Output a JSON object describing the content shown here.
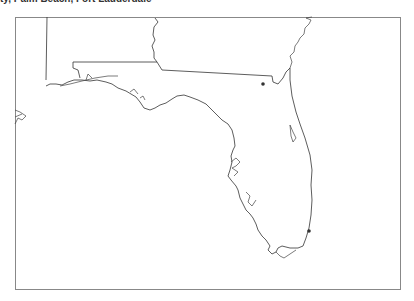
{
  "caption": "ty, Palm Beach, Fort Lauderdale",
  "map": {
    "region": "Florida",
    "frame_color": "#888888",
    "line_color": "#333333",
    "markers": [
      {
        "name": "jacksonville-area-marker",
        "x": 263,
        "y": 84
      },
      {
        "name": "miami-area-marker",
        "x": 309,
        "y": 231
      }
    ]
  }
}
